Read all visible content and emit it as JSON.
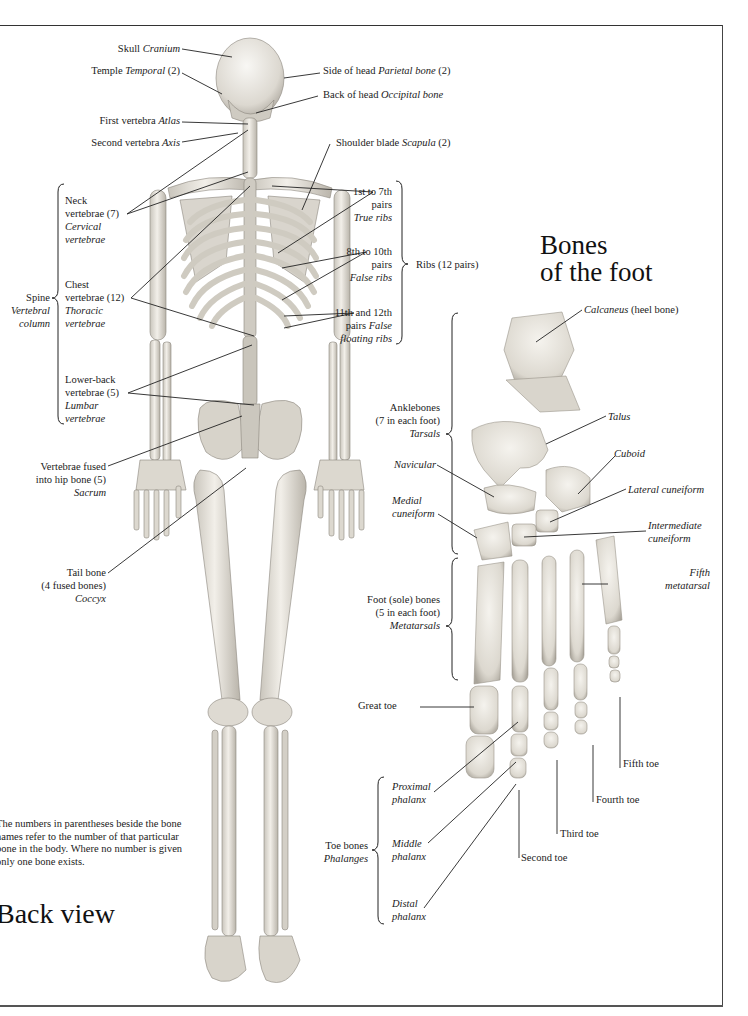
{
  "page": {
    "back_view_title": "Back view",
    "foot_title_line1": "Bones",
    "foot_title_line2": "of the foot",
    "note": "The numbers in parentheses beside the bone names refer to the number of that particular bone in the body. Where no number is given only one bone exists."
  },
  "skeleton_labels": {
    "skull": {
      "common": "Skull",
      "latin": "Cranium"
    },
    "temple": {
      "common": "Temple",
      "latin": "Temporal",
      "count": "(2)"
    },
    "side_of_head": {
      "common": "Side of head",
      "latin": "Parietal bone",
      "count": "(2)"
    },
    "back_of_head": {
      "common": "Back of head",
      "latin": "Occipital bone"
    },
    "first_vertebra": {
      "common": "First vertebra",
      "latin": "Atlas"
    },
    "second_vertebra": {
      "common": "Second vertebra",
      "latin": "Axis"
    },
    "shoulder_blade": {
      "common": "Shoulder blade",
      "latin": "Scapula",
      "count": "(2)"
    },
    "spine": {
      "common": "Spine",
      "latin_1": "Vertebral",
      "latin_2": "column"
    },
    "neck_vertebrae": {
      "line1": "Neck",
      "line2": "vertebrae (7)",
      "latin_1": "Cervical",
      "latin_2": "vertebrae"
    },
    "chest_vertebrae": {
      "line1": "Chest",
      "line2": "vertebrae (12)",
      "latin_1": "Thoracic",
      "latin_2": "vertebrae"
    },
    "lower_back_vertebrae": {
      "line1": "Lower-back",
      "line2": "vertebrae (5)",
      "latin_1": "Lumbar",
      "latin_2": "vertebrae"
    },
    "true_ribs": {
      "line1": "1st to 7th",
      "line2": "pairs",
      "latin": "True ribs"
    },
    "false_ribs": {
      "line1": "8th to 10th",
      "line2": "pairs",
      "latin": "False ribs"
    },
    "floating_ribs": {
      "line1": "11th and 12th",
      "line2": "pairs",
      "latin_1": "False",
      "latin_2": "floating ribs"
    },
    "ribs": {
      "label": "Ribs (12 pairs)"
    },
    "sacrum": {
      "line1": "Vertebrae fused",
      "line2": "into hip bone (5)",
      "latin": "Sacrum"
    },
    "coccyx": {
      "line1": "Tail bone",
      "line2": "(4 fused bones)",
      "latin": "Coccyx"
    }
  },
  "foot_labels": {
    "calcaneus": {
      "latin": "Calcaneus",
      "common": "(heel bone)"
    },
    "talus": {
      "latin": "Talus"
    },
    "cuboid": {
      "latin": "Cuboid"
    },
    "lateral_cuneiform": {
      "latin": "Lateral cuneiform"
    },
    "intermediate_cuneiform": {
      "line1": "Intermediate",
      "line2": "cuneiform"
    },
    "navicular": {
      "latin": "Navicular"
    },
    "medial_cuneiform": {
      "line1": "Medial",
      "line2": "cuneiform"
    },
    "tarsals": {
      "line1": "Anklebones",
      "line2": "(7 in each foot)",
      "latin": "Tarsals"
    },
    "metatarsals": {
      "line1": "Foot (sole) bones",
      "line2": "(5 in each foot)",
      "latin": "Metatarsals"
    },
    "fifth_metatarsal": {
      "line1": "Fifth",
      "line2": "metatarsal"
    },
    "great_toe": {
      "label": "Great toe"
    },
    "second_toe": {
      "label": "Second toe"
    },
    "third_toe": {
      "label": "Third toe"
    },
    "fourth_toe": {
      "label": "Fourth toe"
    },
    "fifth_toe": {
      "label": "Fifth toe"
    },
    "phalanges": {
      "line1": "Toe bones",
      "latin": "Phalanges"
    },
    "proximal_phalanx": {
      "line1": "Proximal",
      "line2": "phalanx"
    },
    "middle_phalanx": {
      "line1": "Middle",
      "line2": "phalanx"
    },
    "distal_phalanx": {
      "line1": "Distal",
      "line2": "phalanx"
    }
  },
  "colors": {
    "bone": "#e9e6df",
    "bone_shadow": "#bdb9b0",
    "line": "#222222",
    "frame": "#333333"
  }
}
